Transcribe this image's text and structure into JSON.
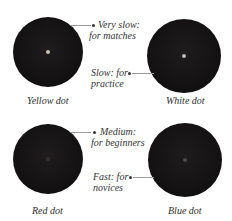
{
  "balls": [
    {
      "name": "Yellow dot",
      "dot_color": "#c8c0b0",
      "speed_label_line1": "Very slow:",
      "speed_label_line2": "for matches"
    },
    {
      "name": "White dot",
      "dot_color": "#bdbdbd",
      "speed_label_line1": "Slow: for",
      "speed_label_line2": "practice"
    },
    {
      "name": "Red dot",
      "dot_color": "#3a3030",
      "speed_label_line1": "Medium:",
      "speed_label_line2": "for beginners"
    },
    {
      "name": "Blue dot",
      "dot_color": "#4a4a4a",
      "speed_label_line1": "Fast: for",
      "speed_label_line2": "novices"
    }
  ],
  "colors": {
    "ball": "#141212",
    "leader_line": "#9a9a9a",
    "text": "#333333"
  }
}
